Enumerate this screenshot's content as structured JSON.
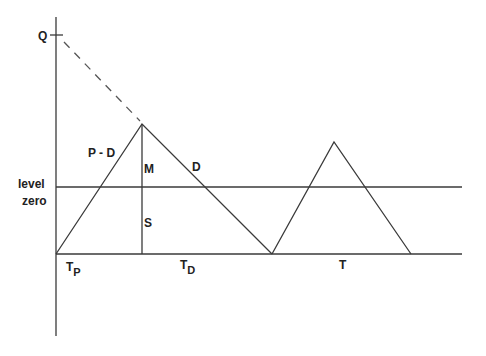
{
  "diagram": {
    "title": "",
    "labels": {
      "q": "Q",
      "p_minus_d": "P - D",
      "m": "M",
      "d": "D",
      "level_line1": "level",
      "level_line2": "zero",
      "s": "S",
      "t_p_main": "T",
      "t_p_sub": "P",
      "t_d_main": "T",
      "t_d_sub": "D",
      "t": "T"
    },
    "geometry": {
      "axis": {
        "x": 56,
        "y_top": 17,
        "y_bottom": 336
      },
      "q_tick": {
        "y": 35
      },
      "baseline_y": 254,
      "level_zero_y": 187,
      "lines_right_end_x": 462,
      "cycle1": {
        "start": [
          56,
          254
        ],
        "peak": [
          142,
          124
        ],
        "end": [
          272,
          254
        ]
      },
      "cycle2": {
        "start": [
          272,
          254
        ],
        "peak": [
          334,
          142
        ],
        "end": [
          411,
          254
        ]
      },
      "dashed_from": [
        63,
        40
      ],
      "dashed_to": [
        142,
        124
      ]
    },
    "colors": {
      "line": "#3a3a3a",
      "text": "#222222",
      "background": "#ffffff"
    }
  }
}
